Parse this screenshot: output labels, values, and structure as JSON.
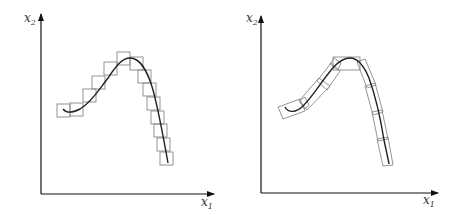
{
  "panels": [
    {
      "id": "left",
      "description": "Curve covered by axis-aligned square boxes",
      "axes": {
        "y_label": "x",
        "y_sub": "2",
        "x_label": "x",
        "x_sub": "1"
      },
      "box_style": "axis-aligned"
    },
    {
      "id": "right",
      "description": "Curve covered by oriented rectangular boxes aligned to curve tangent",
      "axes": {
        "y_label": "x",
        "y_sub": "2",
        "x_label": "x",
        "x_sub": "1"
      },
      "box_style": "oriented"
    }
  ],
  "colors": {
    "axis": "#111111",
    "curve": "#222222",
    "box": "#888888"
  }
}
